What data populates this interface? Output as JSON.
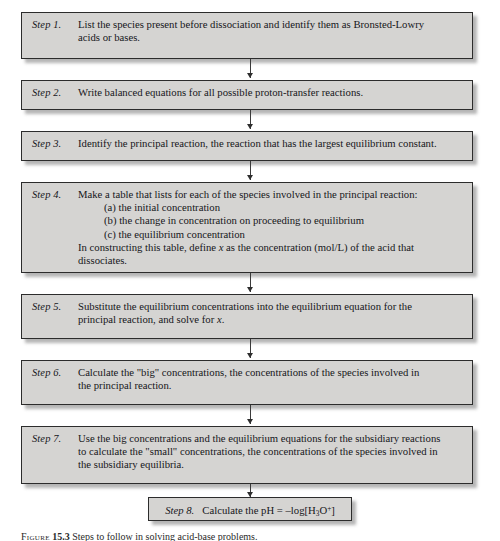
{
  "figure": {
    "type": "flowchart",
    "orientation": "vertical",
    "box_fill_color": "#d5d4d2",
    "box_border_color": "#2c2c2c",
    "background_color": "#ffffff",
    "connector_color": "#3a3a3a"
  },
  "steps": [
    {
      "label": "Step 1.",
      "lines": [
        "List the species present before dissociation and identify them as Bronsted-Lowry",
        "acids or bases."
      ]
    },
    {
      "label": "Step 2.",
      "lines": [
        "Write balanced equations for all possible proton-transfer reactions."
      ]
    },
    {
      "label": "Step 3.",
      "lines": [
        "Identify the principal reaction, the reaction that has the largest equilibrium constant."
      ]
    },
    {
      "label": "Step 4.",
      "lines": [
        "Make a table that lists for each of the species involved in the principal reaction:"
      ],
      "sublines": [
        "(a) the initial concentration",
        "(b) the change in concentration on proceeding to equilibrium",
        "(c) the equilibrium concentration"
      ],
      "continuation": [
        "In constructing this table, define x as the concentration (mol/L) of the acid that",
        "dissociates."
      ]
    },
    {
      "label": "Step 5.",
      "lines": [
        "Substitute the equilibrium concentrations into the equilibrium equation for the",
        "principal reaction, and solve for x."
      ]
    },
    {
      "label": "Step 6.",
      "lines": [
        "Calculate the \"big\" concentrations, the concentrations of the species involved in",
        "the principal reaction."
      ]
    },
    {
      "label": "Step 7.",
      "lines": [
        "Use the big concentrations and the equilibrium equations for the subsidiary reactions",
        "to calculate the \"small\" concentrations, the concentrations of the species involved in",
        "the subsidiary equilibria."
      ]
    }
  ],
  "terminal_step": {
    "label": "Step 8.",
    "text": "Calculate the pH = –log[H3O+]",
    "formula_prefix": "Calculate the pH = –log[H",
    "formula_sub": "3",
    "formula_mid": "O",
    "formula_sup": "+",
    "formula_suffix": "]"
  },
  "caption": {
    "lead": "Figure",
    "number": "15.3",
    "text": "Steps to follow in solving acid-base problems."
  }
}
